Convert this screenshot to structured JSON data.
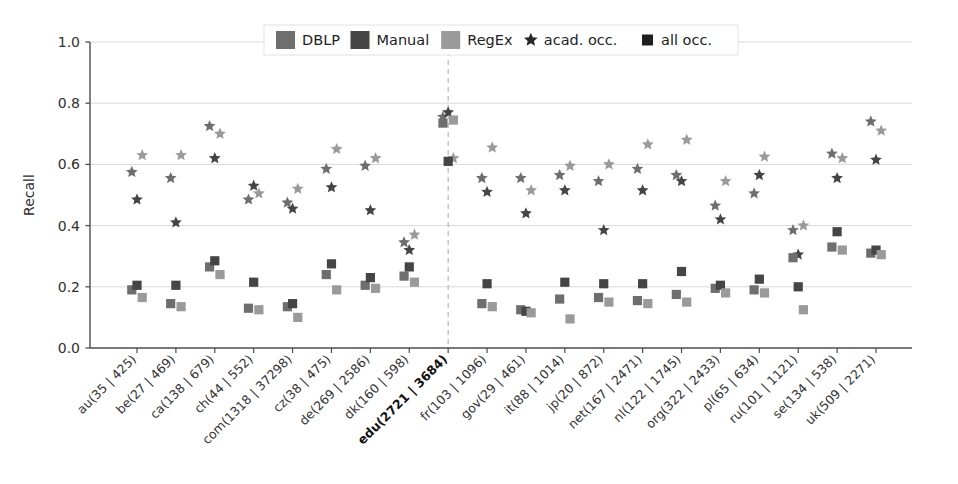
{
  "chart_data": {
    "type": "scatter",
    "title": "",
    "xlabel": "",
    "ylabel": "Recall",
    "ylim": [
      0.0,
      1.0
    ],
    "yticks": [
      "0.0",
      "0.2",
      "0.4",
      "0.6",
      "0.8",
      "1.0"
    ],
    "ytick_values": [
      0.0,
      0.2,
      0.4,
      0.6,
      0.8,
      1.0
    ],
    "grid": true,
    "grid_axis": "y",
    "legend_position": "upper center",
    "highlighted_category": "edu(2721 | 3684)",
    "categories": [
      "au(35 | 425)",
      "be(27 | 469)",
      "ca(138 | 679)",
      "ch(44 | 552)",
      "com(1318 | 37298)",
      "cz(38 | 475)",
      "de(269 | 2586)",
      "dk(160 | 598)",
      "edu(2721 | 3684)",
      "fr(103 | 1096)",
      "gov(29 | 461)",
      "it(88 | 1014)",
      "jp(20 | 872)",
      "net(167 | 2471)",
      "nl(122 | 1745)",
      "org(322 | 2433)",
      "pl(65 | 634)",
      "ru(101 | 1121)",
      "se(134 | 538)",
      "uk(509 | 2271)"
    ],
    "legend": [
      {
        "label": "DBLP",
        "color": "#6e6e6e",
        "marker": "patch"
      },
      {
        "label": "Manual",
        "color": "#454545",
        "marker": "patch"
      },
      {
        "label": "RegEx",
        "color": "#9a9a9a",
        "marker": "patch"
      },
      {
        "label": "acad. occ.",
        "color": "#2a2a2a",
        "marker": "star"
      },
      {
        "label": "all occ.",
        "color": "#1e1e1e",
        "marker": "square"
      }
    ],
    "series": [
      {
        "name": "DBLP acad. occ.",
        "source": "DBLP",
        "occurrence": "acad. occ.",
        "marker": "star",
        "color": "#6e6e6e",
        "values": [
          0.575,
          0.555,
          0.725,
          0.485,
          0.475,
          0.585,
          0.595,
          0.345,
          0.755,
          0.555,
          0.555,
          0.565,
          0.545,
          0.585,
          0.565,
          0.465,
          0.505,
          0.385,
          0.635,
          0.74
        ]
      },
      {
        "name": "Manual acad. occ.",
        "source": "Manual",
        "occurrence": "acad. occ.",
        "marker": "star",
        "color": "#454545",
        "values": [
          0.485,
          0.41,
          0.62,
          0.53,
          0.455,
          0.525,
          0.45,
          0.32,
          0.77,
          0.51,
          0.44,
          0.515,
          0.385,
          0.515,
          0.545,
          0.42,
          0.565,
          0.305,
          0.555,
          0.615
        ]
      },
      {
        "name": "RegEx acad. occ.",
        "source": "RegEx",
        "occurrence": "acad. occ.",
        "marker": "star",
        "color": "#9a9a9a",
        "values": [
          0.63,
          0.63,
          0.7,
          0.505,
          0.52,
          0.65,
          0.62,
          0.37,
          0.62,
          0.655,
          0.515,
          0.595,
          0.6,
          0.665,
          0.68,
          0.545,
          0.625,
          0.4,
          0.62,
          0.71
        ]
      },
      {
        "name": "DBLP all occ.",
        "source": "DBLP",
        "occurrence": "all occ.",
        "marker": "square",
        "color": "#6e6e6e",
        "values": [
          0.19,
          0.145,
          0.265,
          0.13,
          0.135,
          0.24,
          0.205,
          0.235,
          0.735,
          0.145,
          0.125,
          0.16,
          0.165,
          0.155,
          0.175,
          0.195,
          0.19,
          0.295,
          0.33,
          0.31
        ]
      },
      {
        "name": "Manual all occ.",
        "source": "Manual",
        "occurrence": "all occ.",
        "marker": "square",
        "color": "#454545",
        "values": [
          0.205,
          0.205,
          0.285,
          0.215,
          0.145,
          0.275,
          0.23,
          0.265,
          0.61,
          0.21,
          0.12,
          0.215,
          0.21,
          0.21,
          0.25,
          0.205,
          0.225,
          0.2,
          0.38,
          0.32
        ]
      },
      {
        "name": "RegEx all occ.",
        "source": "RegEx",
        "occurrence": "all occ.",
        "marker": "square",
        "color": "#9a9a9a",
        "values": [
          0.165,
          0.135,
          0.24,
          0.125,
          0.1,
          0.19,
          0.195,
          0.215,
          0.745,
          0.135,
          0.115,
          0.095,
          0.15,
          0.145,
          0.15,
          0.18,
          0.18,
          0.125,
          0.32,
          0.305
        ]
      }
    ]
  },
  "axes": {
    "ylabel": "Recall"
  },
  "colors": {
    "dblp": "#6e6e6e",
    "manual": "#454545",
    "regex": "#9a9a9a",
    "star": "#2a2a2a",
    "square": "#1e1e1e",
    "grid": "#d4d4d4",
    "axis": "#4d4d4d",
    "highlight_line": "#b0b0b0"
  }
}
